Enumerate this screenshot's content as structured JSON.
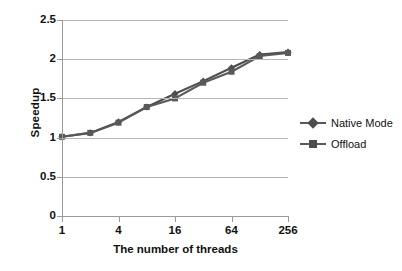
{
  "chart_data": {
    "type": "line",
    "title": "",
    "xlabel": "The number of threads",
    "ylabel": "Speedup",
    "x": [
      1,
      2,
      4,
      8,
      16,
      32,
      64,
      128,
      256
    ],
    "x_tick_labels": [
      "1",
      "4",
      "16",
      "64",
      "256"
    ],
    "x_tick_positions": [
      1,
      4,
      16,
      64,
      256
    ],
    "x_scale": "log2-categorical",
    "ylim": [
      0,
      2.5
    ],
    "y_tick_labels": [
      "0",
      "0.5",
      "1",
      "1.5",
      "2",
      "2.5"
    ],
    "y_tick_values": [
      0,
      0.5,
      1,
      1.5,
      2,
      2.5
    ],
    "grid": true,
    "grid_axis": "y",
    "legend_position": "right",
    "series": [
      {
        "name": "Native Mode",
        "marker": "diamond",
        "color": "#4d4d4d",
        "values": [
          1.01,
          1.06,
          1.2,
          1.39,
          1.56,
          1.72,
          1.89,
          2.06,
          2.09
        ]
      },
      {
        "name": "Offload",
        "marker": "square",
        "color": "#595959",
        "values": [
          1.01,
          1.06,
          1.19,
          1.39,
          1.5,
          1.7,
          1.84,
          2.04,
          2.08
        ]
      }
    ]
  },
  "axes": {
    "y_title": "Speedup",
    "x_title": "The number of threads"
  },
  "legend": {
    "entries": [
      {
        "label": "Native Mode",
        "marker": "diamond-marker-icon"
      },
      {
        "label": "Offload",
        "marker": "square-marker-icon"
      }
    ]
  },
  "colors": {
    "series_native": "#4d4d4d",
    "series_offload": "#595959",
    "gridline": "#b6b6b6",
    "axis": "#9a9a9a",
    "text": "#111111",
    "background": "#ffffff"
  }
}
